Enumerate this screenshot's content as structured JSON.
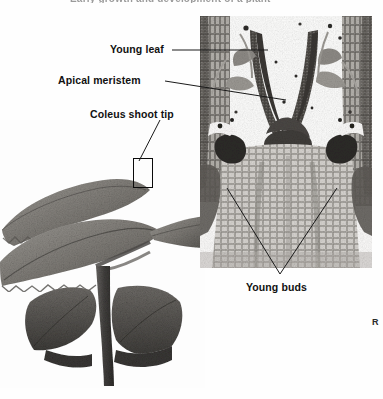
{
  "figure": {
    "caption_cut": "Early growth and development of a plant",
    "corner_mark": "R"
  },
  "labels": {
    "young_leaf": "Young leaf",
    "apical_meristem": "Apical meristem",
    "coleus_shoot_tip": "Coleus shoot tip",
    "young_buds": "Young buds"
  },
  "panels": {
    "plant_photo": {
      "name": "coleus-plant-photograph",
      "description": "Black and white photograph of a Coleus plant shoot with opposite serrated leaves and a vertical stem"
    },
    "micrograph": {
      "name": "shoot-apex-longitudinal-section",
      "description": "Light micrograph of a longitudinal section through a Coleus shoot apex showing the dome-shaped apical meristem, young leaf primordia and two dark axillary young buds"
    }
  },
  "colors": {
    "background": "#ffffff",
    "label_text": "#111111",
    "leader_line": "#1a1a1a",
    "highlight_box": "#0a0a0a",
    "tissue_dark": "#3d3a38",
    "tissue_mid": "#8d8a86",
    "tissue_light": "#d8d5d1"
  }
}
